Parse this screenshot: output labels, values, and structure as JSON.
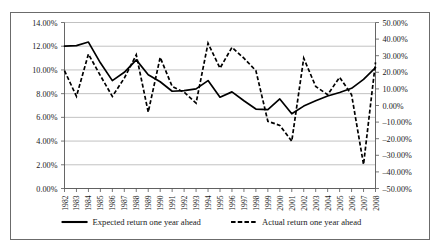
{
  "chart_data": {
    "type": "line",
    "title": "",
    "xlabel": "",
    "ylabel": "",
    "grid": true,
    "legend_position": "bottom",
    "categories": [
      "1982",
      "1983",
      "1984",
      "1985",
      "1986",
      "1987",
      "1988",
      "1989",
      "1990",
      "1991",
      "1992",
      "1993",
      "1994",
      "1995",
      "1996",
      "1997",
      "1998",
      "1999",
      "2000",
      "2001",
      "2002",
      "2003",
      "2004",
      "2005",
      "2006",
      "2007",
      "2008"
    ],
    "axes": {
      "left": {
        "name": "Expected return axis",
        "min": 0,
        "max": 14,
        "step": 2,
        "tick_labels": [
          "0.00%",
          "2.00%",
          "4.00%",
          "6.00%",
          "8.00%",
          "10.00%",
          "12.00%",
          "14.00%"
        ]
      },
      "right": {
        "name": "Actual return axis",
        "min": -50,
        "max": 50,
        "step": 10,
        "tick_labels": [
          "-50.00%",
          "-40.00%",
          "-30.00%",
          "-20.00%",
          "-10.00%",
          "0.00%",
          "10.00%",
          "20.00%",
          "30.00%",
          "40.00%",
          "50.00%"
        ]
      }
    },
    "series": [
      {
        "name": "Expected return one year ahead",
        "axis": "left",
        "style": "solid",
        "color": "#000000",
        "values": [
          12.0,
          12.05,
          12.35,
          10.6,
          9.1,
          9.8,
          10.85,
          9.6,
          9.0,
          8.2,
          8.25,
          8.4,
          9.1,
          7.7,
          8.15,
          7.4,
          6.7,
          6.65,
          7.55,
          6.3,
          6.95,
          7.4,
          7.8,
          8.1,
          8.45,
          9.2,
          10.2
        ]
      },
      {
        "name": "Actual return one year ahead",
        "axis": "right",
        "style": "dashed",
        "color": "#000000",
        "values": [
          21.0,
          5.5,
          31.0,
          18.0,
          5.5,
          16.5,
          30.5,
          -4.0,
          29.0,
          11.5,
          8.0,
          1.5,
          37.5,
          22.5,
          35.0,
          28.5,
          21.0,
          -9.5,
          -12.0,
          -21.5,
          28.5,
          11.5,
          6.5,
          17.0,
          6.5,
          -35.5,
          26.0
        ]
      }
    ]
  },
  "legend": {
    "items": [
      {
        "label": "Expected return one year ahead",
        "style": "solid"
      },
      {
        "label": "Actual return one year ahead",
        "style": "dashed"
      }
    ]
  }
}
